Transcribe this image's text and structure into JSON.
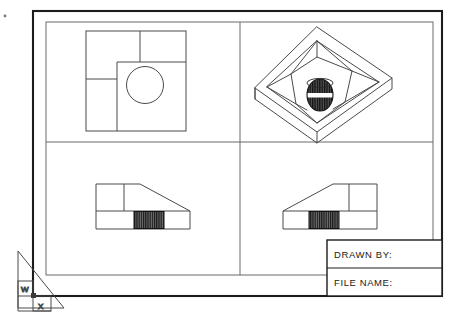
{
  "drawing": {
    "background_color": "#ffffff",
    "line_color": "#3c3c3c",
    "border_color": "#1c1c1c",
    "hatch_color": "#161616"
  },
  "border": {
    "outer": {
      "x": 33,
      "y": 11,
      "width": 409,
      "height": 285
    },
    "inner_viewport_frame": {
      "x": 46,
      "y": 22,
      "width": 387,
      "height": 253
    }
  },
  "viewports": {
    "divider_vertical_x": 240,
    "divider_horizontal_y": 142,
    "items": [
      {
        "name": "top-view",
        "label": "TOP VIEW"
      },
      {
        "name": "isometric-view",
        "label": "ISOMETRIC VIEW"
      },
      {
        "name": "front-view",
        "label": "FRONT VIEW"
      },
      {
        "name": "right-side-view",
        "label": "RIGHT SIDE VIEW"
      }
    ]
  },
  "title_block": {
    "x": 327,
    "y": 240,
    "width": 115,
    "height": 56,
    "divider_y": 268,
    "rows": [
      {
        "label": "DRAWN  BY:",
        "value": ""
      },
      {
        "label": "FILE  NAME:",
        "value": ""
      }
    ]
  },
  "ucs_icon": {
    "name": "wcs-coordinate-icon",
    "w_label": "W",
    "x_label": "X"
  },
  "top_view": {
    "x": 86,
    "y": 31,
    "width": 100,
    "height": 100,
    "notch_x": 117,
    "notch_y": 62,
    "step_line_y": 79,
    "inner_vertical_x": 140,
    "hole": {
      "cx": 145,
      "cy": 85,
      "r": 18.5
    }
  },
  "front_view": {
    "x": 96,
    "y": 184,
    "width": 94,
    "height": 45,
    "top_y": 184,
    "slope_start_x": 140,
    "base_line_y": 211,
    "inner_vertical_x": 124,
    "hatch": {
      "x": 134,
      "y": 211,
      "width": 30,
      "height": 17
    }
  },
  "right_view": {
    "x": 283,
    "y": 184,
    "width": 94,
    "height": 45,
    "top_y": 184,
    "slope_end_x": 333,
    "base_line_y": 211,
    "inner_vertical_x": 349,
    "hatch": {
      "x": 309,
      "y": 211,
      "width": 30,
      "height": 17
    }
  },
  "iso_view": {
    "center_x": 317,
    "center_y": 82,
    "cylinder": {
      "cx": 320,
      "cy": 95,
      "rx": 13,
      "ry": 16
    },
    "band_color": "#ffffff"
  }
}
